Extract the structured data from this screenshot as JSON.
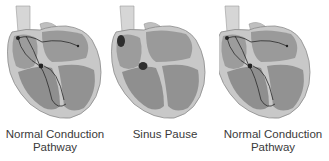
{
  "figure": {
    "panels": [
      {
        "id": "normal-1",
        "label_line1": "Normal Conduction",
        "label_line2": "Pathway",
        "conduction": true
      },
      {
        "id": "sinus-pause",
        "label_line1": "Sinus Pause",
        "label_line2": "",
        "conduction": false
      },
      {
        "id": "normal-2",
        "label_line1": "Normal Conduction",
        "label_line2": "Pathway",
        "conduction": true
      }
    ]
  },
  "colors": {
    "background": "#ffffff",
    "muscle": "#8a8a8a",
    "chamber": "#9c9c9c",
    "wall_light": "#c8c8c8",
    "vessel": "#d6d6d6",
    "pathway": "#2a2a2a",
    "node": "#222222",
    "text": "#3a3a3a"
  }
}
